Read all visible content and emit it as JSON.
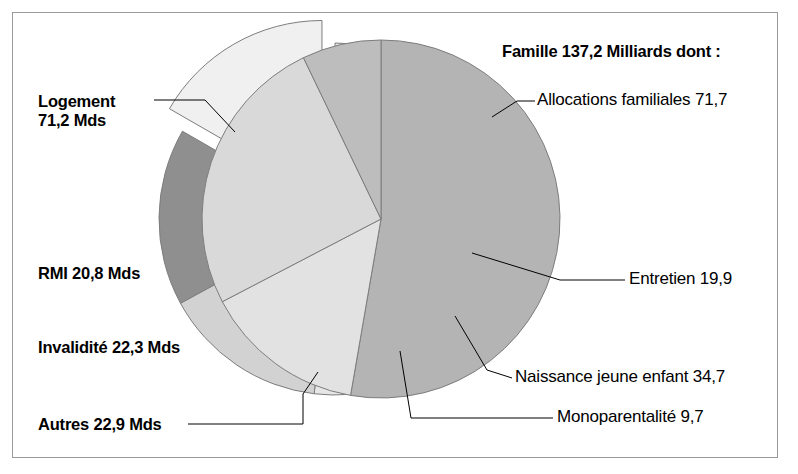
{
  "figure": {
    "background_color": "#ffffff",
    "frame_color": "#9a9a9a",
    "text_color": "#000000"
  },
  "title_right": "Famille 137,2 Milliards dont :",
  "labels": {
    "logement_line1": "Logement",
    "logement_line2": "71,2 Mds",
    "rmi": "RMI 20,8 Mds",
    "invalidite": "Invalidité 22,3 Mds",
    "autres": "Autres 22,9 Mds",
    "allocations": "Allocations familiales 71,7",
    "entretien": "Entretien 19,9",
    "naissance": "Naissance jeune enfant 34,7",
    "monoparentalite": "Monoparentalité 9,7"
  },
  "chart_data": [
    {
      "type": "pie",
      "name": "left-pie",
      "title": "",
      "unit": "Mds",
      "center": [
        335,
        219
      ],
      "radius": 176,
      "start_angle_deg": -90,
      "direction": "clockwise",
      "slices": [
        {
          "label": "Logement",
          "value": 71.2,
          "color": "#e6e6e6",
          "exploded": false
        },
        {
          "label": "RMI",
          "value": 20.8,
          "color": "#d2d2d2",
          "exploded": false
        },
        {
          "label": "Invalidité",
          "value": 22.3,
          "color": "#8f8f8f",
          "exploded": false
        },
        {
          "label": "Autres",
          "value": 22.9,
          "color": "#f0f0f0",
          "exploded": true
        }
      ],
      "total": 137.2,
      "legend": "none"
    },
    {
      "type": "pie",
      "name": "right-pie",
      "title": "Famille 137,2 Milliards dont :",
      "unit": "Milliards",
      "center": [
        381,
        219
      ],
      "radius": 179,
      "start_angle_deg": -90,
      "direction": "clockwise",
      "slices": [
        {
          "label": "Allocations familiales",
          "value": 71.7,
          "color": "#b4b4b4",
          "exploded": false
        },
        {
          "label": "Entretien",
          "value": 19.9,
          "color": "#e2e2e2",
          "exploded": false
        },
        {
          "label": "Naissance jeune enfant",
          "value": 34.7,
          "color": "#d9d9d9",
          "exploded": false
        },
        {
          "label": "Monoparentalité",
          "value": 9.7,
          "color": "#bdbdbd",
          "exploded": false
        }
      ],
      "total": 136.0,
      "legend": "none"
    }
  ]
}
